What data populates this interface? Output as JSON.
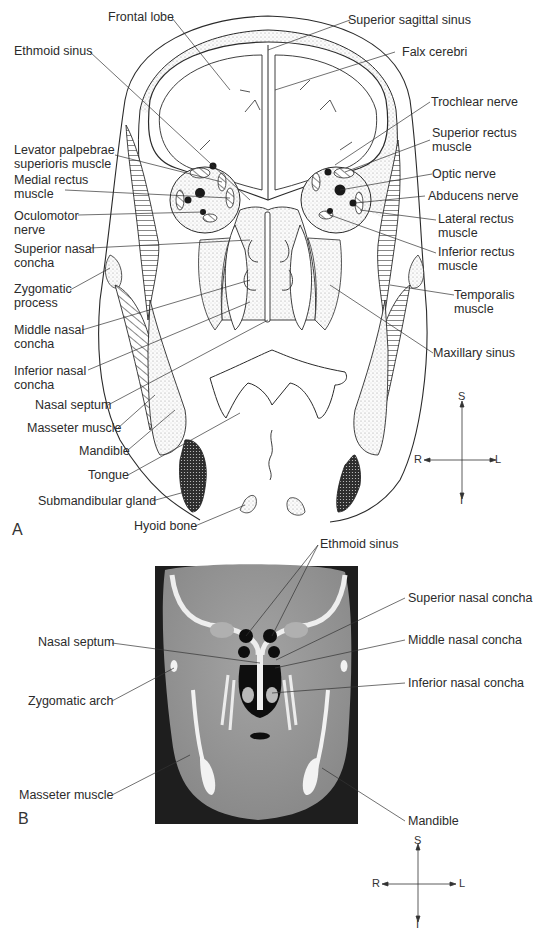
{
  "figure": {
    "panels": [
      {
        "id": "A",
        "letter": "A",
        "type": "coronal-illustration",
        "labels_left": [
          {
            "text": "Ethmoid sinus"
          },
          {
            "text": "Levator palpebrae\nsuperioris muscle"
          },
          {
            "text": "Medial rectus\nmuscle"
          },
          {
            "text": "Oculomotor\nnerve"
          },
          {
            "text": "Superior nasal\nconcha"
          },
          {
            "text": "Zygomatic\nprocess"
          },
          {
            "text": "Middle nasal\nconcha"
          },
          {
            "text": "Inferior nasal\nconcha"
          },
          {
            "text": "Nasal septum"
          },
          {
            "text": "Masseter muscle"
          },
          {
            "text": "Mandible"
          },
          {
            "text": "Tongue"
          },
          {
            "text": "Submandibular gland"
          },
          {
            "text": "Hyoid bone"
          }
        ],
        "labels_top": [
          {
            "text": "Frontal lobe"
          }
        ],
        "labels_right": [
          {
            "text": "Superior sagittal sinus"
          },
          {
            "text": "Falx cerebri"
          },
          {
            "text": "Trochlear nerve"
          },
          {
            "text": "Superior rectus\nmuscle"
          },
          {
            "text": "Optic nerve"
          },
          {
            "text": "Abducens nerve"
          },
          {
            "text": "Lateral rectus\nmuscle"
          },
          {
            "text": "Inferior rectus\nmuscle"
          },
          {
            "text": "Temporalis\nmuscle"
          },
          {
            "text": "Maxillary sinus"
          }
        ],
        "orientation": {
          "superior": "S",
          "inferior": "I",
          "right": "R",
          "left": "L"
        }
      },
      {
        "id": "B",
        "letter": "B",
        "type": "coronal-ct",
        "labels_top": [
          {
            "text": "Ethmoid sinus"
          }
        ],
        "labels_left": [
          {
            "text": "Nasal septum"
          },
          {
            "text": "Zygomatic arch"
          },
          {
            "text": "Masseter muscle"
          }
        ],
        "labels_right": [
          {
            "text": "Superior nasal concha"
          },
          {
            "text": "Middle nasal concha"
          },
          {
            "text": "Inferior nasal concha"
          },
          {
            "text": "Mandible"
          }
        ],
        "orientation": {
          "superior": "S",
          "inferior": "I",
          "right": "R",
          "left": "L"
        }
      }
    ],
    "colors": {
      "ink": "#2a2a2a",
      "stipple": "#d9d9d9",
      "gland": "#3a3a3a",
      "ct_background": "#1e1e1e",
      "ct_soft_tissue": "#9a9a9a",
      "ct_bone": "#f2f2f2",
      "ct_air": "#0e0e0e"
    }
  }
}
